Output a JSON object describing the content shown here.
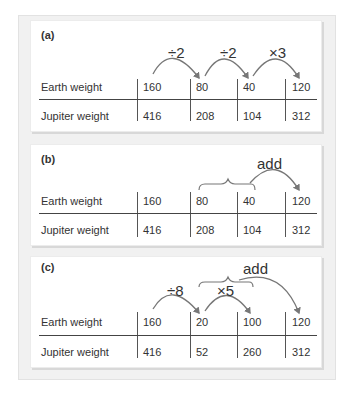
{
  "panels": [
    {
      "label": "(a)",
      "rows": [
        {
          "label": "Earth weight",
          "values": [
            "160",
            "80",
            "40",
            "120"
          ]
        },
        {
          "label": "Jupiter weight",
          "values": [
            "416",
            "208",
            "104",
            "312"
          ]
        }
      ],
      "operations": [
        "÷2",
        "÷2",
        "×3"
      ]
    },
    {
      "label": "(b)",
      "rows": [
        {
          "label": "Earth weight",
          "values": [
            "160",
            "80",
            "40",
            "120"
          ]
        },
        {
          "label": "Jupiter weight",
          "values": [
            "416",
            "208",
            "104",
            "312"
          ]
        }
      ],
      "operations": [
        "add"
      ]
    },
    {
      "label": "(c)",
      "rows": [
        {
          "label": "Earth weight",
          "values": [
            "160",
            "20",
            "100",
            "120"
          ]
        },
        {
          "label": "Jupiter weight",
          "values": [
            "416",
            "52",
            "260",
            "312"
          ]
        }
      ],
      "operations": [
        "÷8",
        "×5",
        "add"
      ]
    }
  ],
  "colors": {
    "arrow": "#777777",
    "text": "#333333",
    "lines": "#555555"
  }
}
